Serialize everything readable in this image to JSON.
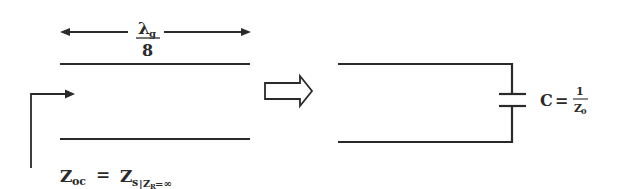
{
  "diagram": {
    "length_label": {
      "numerator_symbol": "λ",
      "numerator_subscript": "g",
      "denominator": "8"
    },
    "input_impedance_label": {
      "lhs": "Z",
      "lhs_subscript": "oc",
      "equals": "=",
      "rhs": "Z",
      "rhs_subscript": "s",
      "condition_bar": "|",
      "condition_var": "Z",
      "condition_var_subscript": "R",
      "condition_value": "=∞"
    },
    "equivalence_arrow": "hollow-right-arrow",
    "capacitor_label": {
      "lhs": "C",
      "equals": "=",
      "numerator": "1",
      "denominator": "Z",
      "denominator_subscript": "0"
    },
    "colors": {
      "line": "#2a2a2a",
      "background": "#ffffff"
    }
  }
}
